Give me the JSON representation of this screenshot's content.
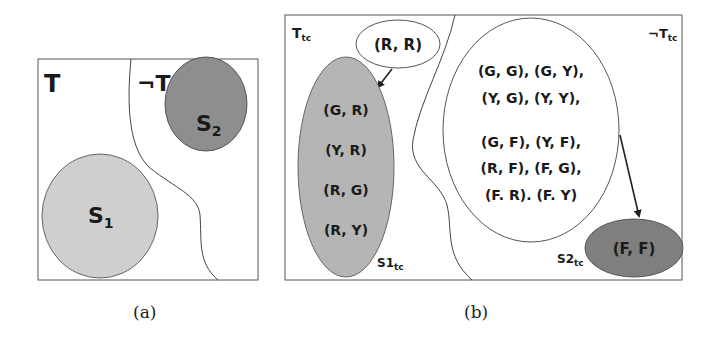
{
  "panel_a": {
    "caption": "(a)",
    "region_left_label": "T",
    "region_right_label": "¬T",
    "set1": {
      "label": "S",
      "subscript": "1",
      "color": "#cfcfcf"
    },
    "set2": {
      "label": "S",
      "subscript": "2",
      "color": "#8e8e8e"
    }
  },
  "panel_b": {
    "caption": "(b)",
    "region_left_label": "T",
    "region_left_sub": "tc",
    "region_right_label": "¬T",
    "region_right_sub": "tc",
    "rr_node": {
      "text": "(R, R)"
    },
    "s1tc": {
      "label": "S1",
      "subscript": "tc",
      "color": "#b5b5b5",
      "items": [
        "(G, R)",
        "(Y, R)",
        "(R, G)",
        "(R, Y)"
      ]
    },
    "big_set": {
      "lines": [
        "(G, G), (G, Y),",
        "(Y, G), (Y, Y),",
        "(G, F), (Y, F),",
        "(R, F), (F, G),",
        "(F. R). (F. Y)"
      ]
    },
    "s2tc": {
      "label": "S2",
      "subscript": "tc",
      "color": "#7f7f7f",
      "items": [
        "(F, F)"
      ]
    }
  }
}
